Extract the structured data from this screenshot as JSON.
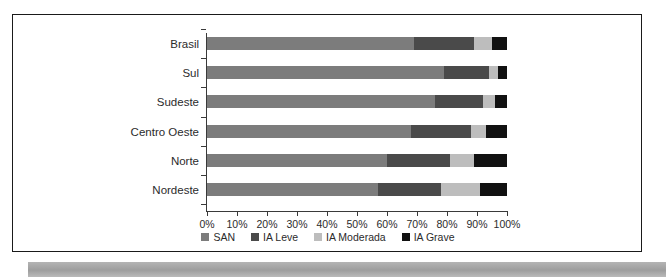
{
  "chart_data": {
    "type": "bar",
    "orientation": "horizontal",
    "stacked": true,
    "normalized": "100%",
    "title": "",
    "xlabel": "",
    "ylabel": "",
    "xlim": [
      0,
      100
    ],
    "grid": false,
    "legend_position": "bottom",
    "categories": [
      "Brasil",
      "Sul",
      "Sudeste",
      "Centro Oeste",
      "Norte",
      "Nordeste"
    ],
    "tick_labels": [
      "0%",
      "10%",
      "20%",
      "30%",
      "40%",
      "50%",
      "60%",
      "70%",
      "80%",
      "90%",
      "100%"
    ],
    "tick_values": [
      0,
      10,
      20,
      30,
      40,
      50,
      60,
      70,
      80,
      90,
      100
    ],
    "series": [
      {
        "name": "SAN",
        "color": "#7c7c7c",
        "values": [
          69,
          79,
          76,
          68,
          60,
          57
        ]
      },
      {
        "name": "IA Leve",
        "color": "#4a4a4a",
        "values": [
          20,
          15,
          16,
          20,
          21,
          21
        ]
      },
      {
        "name": "IA Moderada",
        "color": "#bdbdbd",
        "values": [
          6,
          3,
          4,
          5,
          8,
          13
        ]
      },
      {
        "name": "IA Grave",
        "color": "#111111",
        "values": [
          5,
          3,
          4,
          7,
          11,
          9
        ]
      }
    ]
  },
  "legend": {
    "items": [
      {
        "label": "SAN"
      },
      {
        "label": "IA Leve"
      },
      {
        "label": "IA Moderada"
      },
      {
        "label": "IA Grave"
      }
    ]
  },
  "axis": {
    "categories": [
      {
        "label": "Brasil"
      },
      {
        "label": "Sul"
      },
      {
        "label": "Sudeste"
      },
      {
        "label": "Centro Oeste"
      },
      {
        "label": "Norte"
      },
      {
        "label": "Nordeste"
      }
    ],
    "ticks": [
      {
        "label": "0%"
      },
      {
        "label": "10%"
      },
      {
        "label": "20%"
      },
      {
        "label": "30%"
      },
      {
        "label": "40%"
      },
      {
        "label": "50%"
      },
      {
        "label": "60%"
      },
      {
        "label": "70%"
      },
      {
        "label": "80%"
      },
      {
        "label": "90%"
      },
      {
        "label": "100%"
      }
    ]
  }
}
